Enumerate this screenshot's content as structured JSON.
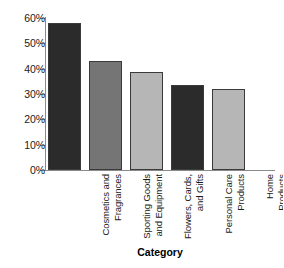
{
  "chart_data": {
    "type": "bar",
    "title": "",
    "xlabel": "Category",
    "ylabel": "",
    "categories": [
      "Cosmetics and Fragrances",
      "Sporting Goods and Equipment",
      "Flowers, Cards, and Gifts",
      "Personal Care Products",
      "Home Products"
    ],
    "category_lines": [
      "Cosmetics and\nFragrances",
      "Sporting Goods\nand Equipment",
      "Flowers, Cards,\nand Gifts",
      "Personal Care\nProducts",
      "Home\nProducts"
    ],
    "values": [
      58,
      43,
      38.7,
      33.4,
      32
    ],
    "value_labels": [
      "58%",
      "43%",
      "38.7%",
      "33.4%",
      "32%"
    ],
    "bar_colors": [
      "#2b2b2b",
      "#757575",
      "#b6b6b6",
      "#2b2b2b",
      "#b6b6b6"
    ],
    "ylim": [
      0,
      60
    ],
    "ytick_values": [
      0,
      10,
      20,
      30,
      40,
      50,
      60
    ],
    "ytick_labels": [
      "0%",
      "10%",
      "20%",
      "30%",
      "40%",
      "50%",
      "60%"
    ],
    "grid": false,
    "legend": "none"
  }
}
